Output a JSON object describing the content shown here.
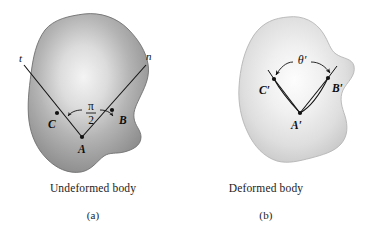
{
  "figure": {
    "background_color": "#ffffff",
    "ink_color": "#111111",
    "panels": [
      {
        "id": "panel-a",
        "caption_title": "Undeformed body",
        "caption_index": "(a)",
        "body_fill_light": "#f2f2f2",
        "body_fill_mid": "#b9b9b9",
        "body_fill_dark": "#8e8e8e",
        "body_stroke": "#6f6f6f",
        "ray_labels": [
          {
            "name": "t-axis-label",
            "text": "t",
            "x": 19,
            "y": 62
          },
          {
            "name": "n-axis-label",
            "text": "n",
            "x": 147,
            "y": 60
          }
        ],
        "point_labels": [
          {
            "name": "point-c-label",
            "text": "C",
            "x": 48,
            "y": 128
          },
          {
            "name": "point-a-label",
            "text": "A",
            "x": 79,
            "y": 152
          },
          {
            "name": "point-b-label",
            "text": "B",
            "x": 120,
            "y": 124
          }
        ],
        "angle_annotation": {
          "name": "right-angle-pi-over-two",
          "numerator": "π",
          "denominator": "2",
          "value_text": "π/2",
          "x": 85,
          "y": 112
        }
      },
      {
        "id": "panel-b",
        "caption_title": "Deformed body",
        "caption_index": "(b)",
        "body_fill_light": "#fbfbfb",
        "body_fill_mid": "#e4e4e4",
        "body_fill_dark": "#cfcfcf",
        "body_stroke": "#b4b4b4",
        "ray_labels": [],
        "point_labels": [
          {
            "name": "point-c-prime-label",
            "text": "C′",
            "x": 262,
            "y": 93
          },
          {
            "name": "point-a-prime-label",
            "text": "A′",
            "x": 292,
            "y": 128
          },
          {
            "name": "point-b-prime-label",
            "text": "B′",
            "x": 333,
            "y": 91
          }
        ],
        "angle_annotation": {
          "name": "deformed-angle-theta-prime",
          "value_text": "θ′",
          "x": 300,
          "y": 62
        }
      }
    ]
  }
}
